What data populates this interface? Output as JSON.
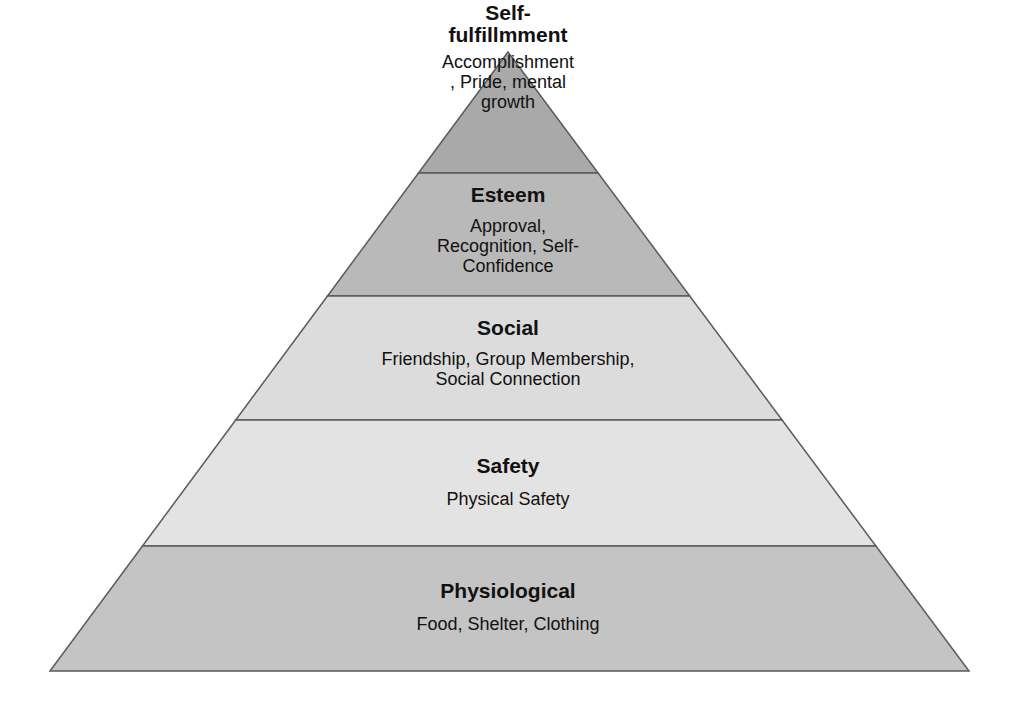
{
  "diagram": {
    "type": "pyramid",
    "apex": {
      "x": 508,
      "y": 52
    },
    "base": {
      "left": 50,
      "right": 969,
      "y": 671
    },
    "outline_color": "#5a5a5a",
    "levels": [
      {
        "title": "Self-\nfulfillmment",
        "description": "Accomplishment\n, Pride, mental\ngrowth",
        "fill": "#a9a9a9",
        "y_top": 52,
        "y_bottom": 173,
        "text_top": 2,
        "text_width": 190
      },
      {
        "title": "Esteem",
        "description": "Approval,\nRecognition, Self-\nConfidence",
        "fill": "#b9b9b9",
        "y_top": 173,
        "y_bottom": 296,
        "text_top": 184,
        "text_width": 220
      },
      {
        "title": "Social",
        "description": "Friendship, Group Membership,\nSocial Connection",
        "fill": "#dcdcdc",
        "y_top": 296,
        "y_bottom": 420,
        "text_top": 317,
        "text_width": 400
      },
      {
        "title": "Safety",
        "description": "Physical Safety",
        "fill": "#e3e3e3",
        "y_top": 420,
        "y_bottom": 546,
        "text_top": 455,
        "text_width": 300
      },
      {
        "title": "Physiological",
        "description": "Food, Shelter, Clothing",
        "fill": "#c4c4c4",
        "y_top": 546,
        "y_bottom": 671,
        "text_top": 580,
        "text_width": 300
      }
    ]
  }
}
